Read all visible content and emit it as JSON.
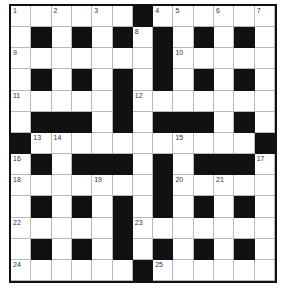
{
  "puzzle": {
    "rows": 13,
    "cols": 13,
    "colors": {
      "block": "#111111",
      "cell": "#ffffff",
      "gridline": "#b8b8b8",
      "number": "#333333"
    },
    "layout": [
      "######.######",
      "#.#.#.#.#.#.#",
      "......#......",
      "#.#.#.#.#.#.#",
      ".....#.......",
      "#...#.#...#.#",
      ".........#...",
      "#.#...#.#...#",
      "......#......",
      "#.#.#.#.#.#.#",
      ".....#.......",
      "#.#.#.#.#.#.#",
      "......#......"
    ],
    "grid": [
      [
        "W",
        "W",
        "W",
        "W",
        "W",
        "W",
        "B",
        "W",
        "W",
        "W",
        "W",
        "W",
        "W"
      ],
      [
        "W",
        "B",
        "W",
        "B",
        "W",
        "B",
        "W",
        "B",
        "W",
        "B",
        "W",
        "B",
        "W"
      ],
      [
        "W",
        "W",
        "W",
        "W",
        "W",
        "W",
        "W",
        "B",
        "W",
        "W",
        "W",
        "W",
        "W"
      ],
      [
        "W",
        "B",
        "W",
        "B",
        "W",
        "B",
        "W",
        "B",
        "W",
        "B",
        "W",
        "B",
        "W"
      ],
      [
        "W",
        "W",
        "W",
        "W",
        "W",
        "B",
        "W",
        "W",
        "W",
        "W",
        "W",
        "W",
        "W"
      ],
      [
        "W",
        "B",
        "B",
        "B",
        "W",
        "B",
        "W",
        "B",
        "B",
        "B",
        "W",
        "B",
        "W"
      ],
      [
        "B",
        "W",
        "W",
        "W",
        "W",
        "W",
        "W",
        "W",
        "W",
        "W",
        "W",
        "W",
        "B"
      ],
      [
        "W",
        "B",
        "W",
        "B",
        "B",
        "B",
        "W",
        "B",
        "W",
        "B",
        "B",
        "B",
        "W"
      ],
      [
        "W",
        "W",
        "W",
        "W",
        "W",
        "W",
        "W",
        "B",
        "W",
        "W",
        "W",
        "W",
        "W"
      ],
      [
        "W",
        "B",
        "W",
        "B",
        "W",
        "B",
        "W",
        "B",
        "W",
        "B",
        "W",
        "B",
        "W"
      ],
      [
        "W",
        "W",
        "W",
        "W",
        "W",
        "B",
        "W",
        "W",
        "W",
        "W",
        "W",
        "W",
        "W"
      ],
      [
        "W",
        "B",
        "W",
        "B",
        "W",
        "B",
        "W",
        "B",
        "W",
        "B",
        "W",
        "B",
        "W"
      ],
      [
        "W",
        "W",
        "W",
        "W",
        "W",
        "W",
        "B",
        "W",
        "W",
        "W",
        "W",
        "W",
        "W"
      ]
    ],
    "numbers": [
      {
        "n": "1",
        "r": 0,
        "c": 0
      },
      {
        "n": "2",
        "r": 0,
        "c": 2
      },
      {
        "n": "3",
        "r": 0,
        "c": 4
      },
      {
        "n": "4",
        "r": 0,
        "c": 7
      },
      {
        "n": "5",
        "r": 0,
        "c": 8
      },
      {
        "n": "6",
        "r": 0,
        "c": 10
      },
      {
        "n": "7",
        "r": 0,
        "c": 12
      },
      {
        "n": "8",
        "r": 1,
        "c": 6
      },
      {
        "n": "9",
        "r": 2,
        "c": 0
      },
      {
        "n": "10",
        "r": 2,
        "c": 8
      },
      {
        "n": "11",
        "r": 4,
        "c": 0
      },
      {
        "n": "12",
        "r": 4,
        "c": 6
      },
      {
        "n": "13",
        "r": 6,
        "c": 1
      },
      {
        "n": "14",
        "r": 6,
        "c": 2
      },
      {
        "n": "15",
        "r": 6,
        "c": 8
      },
      {
        "n": "16",
        "r": 7,
        "c": 0
      },
      {
        "n": "17",
        "r": 7,
        "c": 12
      },
      {
        "n": "18",
        "r": 8,
        "c": 0
      },
      {
        "n": "19",
        "r": 8,
        "c": 4
      },
      {
        "n": "20",
        "r": 8,
        "c": 8
      },
      {
        "n": "21",
        "r": 8,
        "c": 10
      },
      {
        "n": "22",
        "r": 10,
        "c": 0
      },
      {
        "n": "23",
        "r": 10,
        "c": 6
      },
      {
        "n": "24",
        "r": 12,
        "c": 0
      },
      {
        "n": "25",
        "r": 12,
        "c": 7
      }
    ]
  }
}
